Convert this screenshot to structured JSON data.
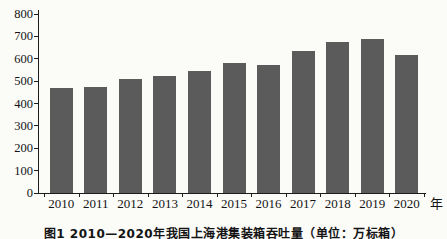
{
  "chart_data": {
    "type": "bar",
    "title": "",
    "categories": [
      "2010",
      "2011",
      "2012",
      "2013",
      "2014",
      "2015",
      "2016",
      "2017",
      "2018",
      "2019",
      "2020"
    ],
    "values": [
      470,
      475,
      510,
      525,
      545,
      580,
      570,
      635,
      675,
      690,
      615
    ],
    "xlabel": "年",
    "ylabel": "",
    "ylim": [
      0,
      800
    ],
    "yticks": [
      0,
      100,
      200,
      300,
      400,
      500,
      600,
      700,
      800
    ],
    "grid": false,
    "legend": "none",
    "bar_color": "#5b5b5b"
  },
  "caption": {
    "text": "图1  2010—2020年我国上海港集装箱吞吐量（单位：万标箱）"
  },
  "colors": {
    "background": "#fbfbf8",
    "bar": "#5b5b5b",
    "axis": "#1c1c1c",
    "text": "#141414"
  }
}
